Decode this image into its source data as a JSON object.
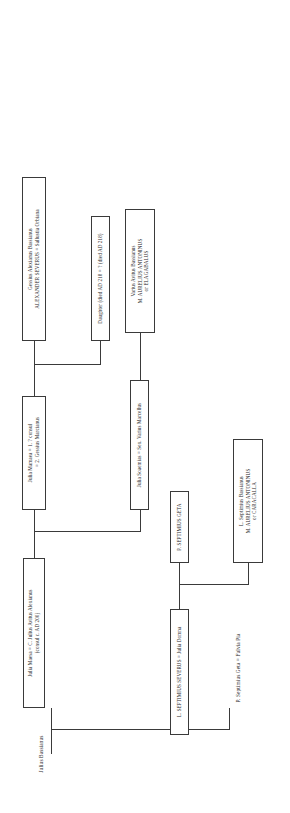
{
  "diagram": {
    "type": "genealogy-tree",
    "orientation": "rotated-90",
    "line_color": "#3a3a3a",
    "background": "#ffffff"
  },
  "nodes": {
    "julius_bassianus": {
      "lines": [
        "Julius Bassianus"
      ],
      "boxed": false
    },
    "septimius_geta_sr": {
      "lines": [
        "P. Septimius Geta = Fulvia Pia"
      ],
      "boxed": false
    },
    "julia_maesa": {
      "lines": [
        "Julia Maesa = C. Julius Avitus  Alexianus",
        "(consul c. AD 200)"
      ],
      "boxed": true
    },
    "septimius_severus": {
      "lines": [
        "L. SEPTIMIUS SEVERUS = Julia Domna"
      ],
      "boxed": true
    },
    "julia_mamaea": {
      "lines": [
        "Julia Mamaea = 1. ? consul",
        "= 2. Gessius Marcianus"
      ],
      "boxed": true
    },
    "julia_soaemias": {
      "lines": [
        "Julia Soaemias = Sex. Varius Marcellus"
      ],
      "boxed": true
    },
    "septimius_geta_jr": {
      "lines": [
        "P. SEPTIMIUS GETA"
      ],
      "boxed": true
    },
    "caracalla": {
      "lines": [
        "L. Septimius Bassianus",
        "M. AURELIUS ANTONINUS",
        "or CARACALLA"
      ],
      "boxed": true
    },
    "elagabalus": {
      "lines": [
        "Varius Avitus Bassianus",
        "M. AURELIUS ANTONINUS",
        "or ELAGABALUS"
      ],
      "boxed": true
    },
    "daughter": {
      "lines": [
        "Daughter (died AD 218 = ? (died AD 218)"
      ],
      "boxed": true
    },
    "alexander_severus": {
      "lines": [
        "Gessius Alexianus Bassianus",
        "ALEXANDER SEVERUS = Sallustia Orbiana"
      ],
      "boxed": true
    }
  }
}
